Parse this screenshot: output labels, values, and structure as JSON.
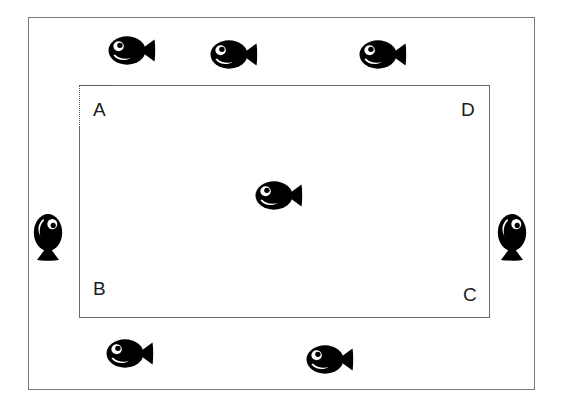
{
  "figure": {
    "background_color": "#ffffff",
    "frame_color": "#7a7a7a",
    "inner_rect_color": "#6b6b6b",
    "fish_color": "#000000",
    "label_color": "#1a1a1a"
  },
  "outer_frame": {
    "name": "outer tank boundary"
  },
  "inner_rect": {
    "name": "inner rectangle ABCD",
    "corner_labels": [
      {
        "id": "A",
        "text": "A",
        "position": "top-left"
      },
      {
        "id": "D",
        "text": "D",
        "position": "top-right"
      },
      {
        "id": "B",
        "text": "B",
        "position": "bottom-left"
      },
      {
        "id": "C",
        "text": "C",
        "position": "bottom-right"
      }
    ]
  },
  "fish": [
    {
      "id": "fish-top-left",
      "label": "fish",
      "orientation": "horizontal",
      "region": "above-rectangle",
      "x": 108,
      "y": 35
    },
    {
      "id": "fish-top-middle",
      "label": "fish",
      "orientation": "horizontal",
      "region": "above-rectangle",
      "x": 210,
      "y": 39
    },
    {
      "id": "fish-top-right",
      "label": "fish",
      "orientation": "horizontal",
      "region": "above-rectangle",
      "x": 359,
      "y": 39
    },
    {
      "id": "fish-left",
      "label": "fish",
      "orientation": "vertical",
      "region": "left-of-rectangle",
      "x": 32,
      "y": 213
    },
    {
      "id": "fish-center",
      "label": "fish",
      "orientation": "horizontal",
      "region": "inside-rectangle",
      "x": 255,
      "y": 180
    },
    {
      "id": "fish-right",
      "label": "fish",
      "orientation": "vertical",
      "region": "right-of-rectangle",
      "x": 496,
      "y": 213
    },
    {
      "id": "fish-bottom-left",
      "label": "fish",
      "orientation": "horizontal",
      "region": "below-rectangle",
      "x": 106,
      "y": 338
    },
    {
      "id": "fish-bottom-right",
      "label": "fish",
      "orientation": "horizontal",
      "region": "below-rectangle",
      "x": 306,
      "y": 344
    }
  ],
  "counts": {
    "total_fish": 8,
    "fish_inside_rectangle": 1,
    "fish_outside_rectangle": 7
  }
}
